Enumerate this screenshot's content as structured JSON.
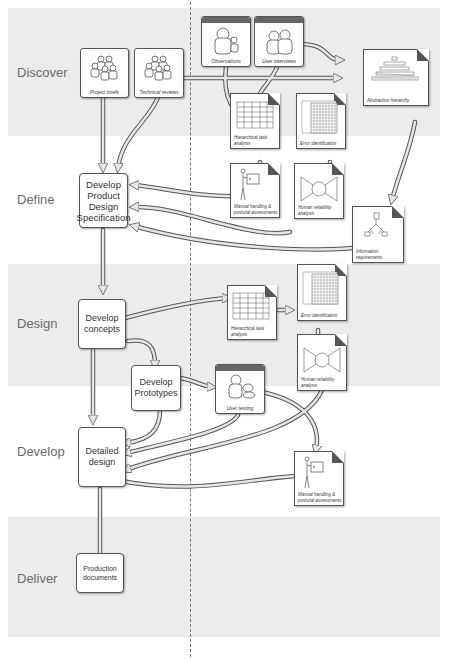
{
  "phases": [
    {
      "label": "Discover"
    },
    {
      "label": "Define"
    },
    {
      "label": "Design"
    },
    {
      "label": "Develop"
    },
    {
      "label": "Deliver"
    }
  ],
  "process_nodes": {
    "develop_pds": "Develop Product Design Specification",
    "develop_concepts": "Develop concepts",
    "develop_prototypes": "Develop Prototypes",
    "detailed_design": "Detailed design",
    "production_documents": "Production documents"
  },
  "sources": {
    "project_briefs": "Project briefs",
    "technical_reviews": "Technical reviews",
    "observations": "Observations",
    "user_interviews": "User interviews",
    "user_testing": "User testing"
  },
  "documents": {
    "abstraction_hierarchy": "Abstraction hierarchy",
    "hta_1": "Hierarchical task analysis",
    "error_id_1": "Error identification",
    "manual_handling_1": "Manual handling & postural assessments",
    "human_reliability_1": "Human reliability analysis",
    "information_requirements": "Information requirements",
    "hta_2": "Hierarchical task analysis",
    "error_id_2": "Error identification",
    "human_reliability_2": "Human reliability analysis",
    "manual_handling_2": "Manual handling & postural assessments"
  },
  "colors": {
    "band": "#ececec",
    "border": "#555555",
    "arrow_fill": "#e6e6e6",
    "phase_text": "#6b6b6b"
  }
}
